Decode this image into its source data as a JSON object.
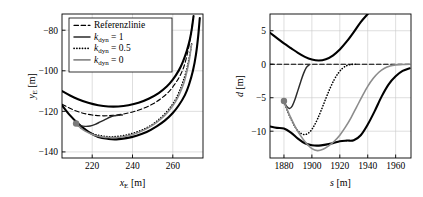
{
  "figure": {
    "panels": [
      "left",
      "right"
    ]
  },
  "chart_data": [
    {
      "id": "left",
      "type": "line",
      "title": "",
      "xlabel": "x_E [m]",
      "ylabel": "y_E [m]",
      "xlabel_parts": {
        "sym": "x",
        "sub": "E",
        "unit": "[m]"
      },
      "ylabel_parts": {
        "sym": "y",
        "sub": "E",
        "unit": "[m]"
      },
      "xlim": [
        205,
        275
      ],
      "ylim": [
        -143,
        -72
      ],
      "xticks": [
        220,
        240,
        260
      ],
      "yticks": [
        -80,
        -100,
        -120,
        -140
      ],
      "xticklabels": [
        "220",
        "240",
        "260"
      ],
      "yticklabels": [
        "-80",
        "-100",
        "-120",
        "-140"
      ],
      "grid": true,
      "legend_position": "upper-left",
      "legend_entries": [
        {
          "label": "Referenzlinie",
          "style": "dashed",
          "color": "#000000"
        },
        {
          "label": "k_dyn = 1",
          "style": "solid",
          "color": "#000000"
        },
        {
          "label": "k_dyn = 0.5",
          "style": "dotted",
          "color": "#000000"
        },
        {
          "label": "k_dyn = 0",
          "style": "solid",
          "color": "#8c8c8c"
        }
      ],
      "series": [
        {
          "name": "road-boundary-outer",
          "style": "solid-thick",
          "color": "#000000",
          "x": [
            205,
            209,
            213,
            218,
            223,
            228,
            233,
            238,
            243,
            248,
            253,
            257,
            260,
            263,
            265,
            267,
            268.5,
            269.5,
            270.3
          ],
          "y": [
            -110.0,
            -112.2,
            -114.0,
            -115.8,
            -117.0,
            -117.6,
            -117.6,
            -117.0,
            -115.8,
            -113.8,
            -111.0,
            -107.8,
            -104.4,
            -99.8,
            -95.6,
            -90.0,
            -84.5,
            -79.0,
            -73.0
          ]
        },
        {
          "name": "road-boundary-inner",
          "style": "solid-thick",
          "color": "#000000",
          "x": [
            205,
            209,
            213,
            218,
            223,
            228,
            232,
            237,
            242,
            247,
            252,
            256,
            260,
            263,
            266,
            268,
            270,
            271.5,
            272.6,
            273.4
          ],
          "y": [
            -117.0,
            -122.0,
            -126.0,
            -130.0,
            -132.6,
            -133.6,
            -133.8,
            -133.2,
            -132.0,
            -130.2,
            -127.4,
            -124.6,
            -120.8,
            -117.0,
            -112.0,
            -107.0,
            -100.0,
            -92.0,
            -83.0,
            -74.0
          ]
        },
        {
          "name": "reference-line",
          "style": "dashed",
          "color": "#000000",
          "x": [
            205,
            210,
            215,
            220,
            225,
            230,
            235,
            240,
            245,
            250,
            254,
            258,
            261,
            263.5,
            265.5,
            267,
            268.2,
            269.2,
            270
          ],
          "y": [
            -116.5,
            -119.0,
            -120.8,
            -121.8,
            -122.2,
            -122.0,
            -121.4,
            -120.3,
            -118.7,
            -116.4,
            -113.8,
            -110.4,
            -106.6,
            -102.6,
            -98.0,
            -92.6,
            -87.0,
            -81.0,
            -75.0
          ]
        },
        {
          "name": "trajectory-kdyn-1",
          "style": "solid",
          "color": "#2b2b2b",
          "x": [
            212,
            214,
            216.5,
            219,
            221.5,
            224,
            226.5,
            229,
            230.8,
            232,
            233.5,
            235
          ],
          "y": [
            -126.0,
            -126.9,
            -127.4,
            -127.2,
            -126.4,
            -125.2,
            -124.0,
            -122.8,
            -122.2,
            -122.0,
            -121.9,
            -121.8
          ]
        },
        {
          "name": "trajectory-kdyn-05",
          "style": "dotted",
          "color": "#000000",
          "x": [
            212,
            215,
            218,
            221,
            224,
            227,
            230,
            234,
            238,
            242,
            246,
            250,
            254,
            257.5,
            260.5,
            263,
            265,
            266.8,
            268.2,
            269.4
          ],
          "y": [
            -126.4,
            -128.6,
            -130.2,
            -131.3,
            -132.0,
            -132.4,
            -132.5,
            -132.2,
            -131.4,
            -130.2,
            -128.6,
            -126.4,
            -123.2,
            -119.6,
            -115.6,
            -110.8,
            -105.6,
            -99.8,
            -93.4,
            -86.6
          ]
        },
        {
          "name": "trajectory-kdyn-0",
          "style": "solid",
          "color": "#8c8c8c",
          "x": [
            212,
            214.5,
            217,
            219.5,
            222,
            225,
            228,
            232,
            236,
            240,
            244,
            248,
            252,
            256,
            259,
            261.5,
            263.5,
            265.5,
            267,
            268.3,
            269.3
          ],
          "y": [
            -126.0,
            -128.4,
            -130.0,
            -131.2,
            -132.0,
            -132.6,
            -132.9,
            -132.9,
            -132.4,
            -131.4,
            -130.0,
            -128.0,
            -125.4,
            -122.0,
            -118.6,
            -115.0,
            -111.0,
            -106.0,
            -100.4,
            -94.0,
            -87.0
          ]
        }
      ],
      "markers": [
        {
          "name": "start-position",
          "x": 212,
          "y": -126.0,
          "color": "#7a7a7a",
          "radius": 3.2
        }
      ]
    },
    {
      "id": "right",
      "type": "line",
      "title": "",
      "xlabel": "s [m]",
      "ylabel": "d [m]",
      "xlabel_parts": {
        "sym": "s",
        "sub": "",
        "unit": "[m]"
      },
      "ylabel_parts": {
        "sym": "d",
        "sub": "",
        "unit": "[m]"
      },
      "xlim": [
        1870,
        1971
      ],
      "ylim": [
        -14.0,
        7.5
      ],
      "xticks": [
        1880,
        1900,
        1920,
        1940,
        1960
      ],
      "yticks": [
        5,
        0,
        -5,
        -10
      ],
      "xticklabels": [
        "1880",
        "1900",
        "1920",
        "1940",
        "1960"
      ],
      "yticklabels": [
        "5",
        "0",
        "-5",
        "-10"
      ],
      "grid": true,
      "legend_position": "none",
      "series": [
        {
          "name": "road-boundary-upper",
          "style": "solid-thick",
          "color": "#000000",
          "x": [
            1870,
            1875,
            1880,
            1885,
            1890,
            1895,
            1900,
            1905,
            1910,
            1915,
            1920,
            1925,
            1930,
            1935,
            1940,
            1943
          ],
          "y": [
            4.7,
            3.9,
            3.1,
            2.4,
            1.7,
            1.1,
            0.7,
            0.55,
            0.75,
            1.3,
            2.2,
            3.4,
            4.8,
            6.3,
            7.5,
            8.2
          ]
        },
        {
          "name": "road-boundary-lower",
          "style": "solid-thick",
          "color": "#000000",
          "x": [
            1870,
            1875,
            1880,
            1885,
            1890,
            1895,
            1900,
            1905,
            1910,
            1915,
            1920,
            1925,
            1930,
            1935,
            1940,
            1945,
            1950,
            1955,
            1960,
            1965,
            1970
          ],
          "y": [
            -9.3,
            -9.5,
            -9.6,
            -10.2,
            -11.1,
            -11.8,
            -12.1,
            -12.15,
            -12.0,
            -11.8,
            -11.5,
            -11.4,
            -11.35,
            -10.6,
            -9.0,
            -7.0,
            -4.8,
            -3.0,
            -1.8,
            -1.0,
            -0.6
          ]
        },
        {
          "name": "reference-line",
          "style": "dashed",
          "color": "#000000",
          "x": [
            1870,
            1970
          ],
          "y": [
            0.0,
            0.0
          ]
        },
        {
          "name": "trajectory-kdyn-1",
          "style": "solid",
          "color": "#2b2b2b",
          "x": [
            1880,
            1882,
            1884,
            1886,
            1888,
            1890,
            1892,
            1894,
            1896,
            1898
          ],
          "y": [
            -5.5,
            -6.3,
            -6.6,
            -6.2,
            -5.2,
            -3.9,
            -2.6,
            -1.4,
            -0.5,
            -0.1
          ]
        },
        {
          "name": "trajectory-kdyn-05",
          "style": "dotted",
          "color": "#000000",
          "x": [
            1880,
            1883,
            1886,
            1889,
            1892,
            1895,
            1898,
            1901,
            1904,
            1907,
            1910,
            1913,
            1916,
            1919,
            1922,
            1925,
            1928,
            1931
          ],
          "y": [
            -5.6,
            -7.2,
            -8.6,
            -9.7,
            -10.3,
            -10.5,
            -10.2,
            -9.4,
            -8.2,
            -6.7,
            -5.1,
            -3.6,
            -2.3,
            -1.3,
            -0.6,
            -0.2,
            -0.05,
            0.0
          ]
        },
        {
          "name": "trajectory-kdyn-0",
          "style": "solid",
          "color": "#8c8c8c",
          "x": [
            1880,
            1884,
            1888,
            1892,
            1896,
            1900,
            1904,
            1908,
            1912,
            1916,
            1920,
            1924,
            1928,
            1932,
            1936,
            1940,
            1944,
            1948,
            1952,
            1956,
            1960,
            1965,
            1970
          ],
          "y": [
            -5.6,
            -7.6,
            -9.3,
            -10.7,
            -11.8,
            -12.6,
            -12.9,
            -12.7,
            -12.2,
            -11.5,
            -10.6,
            -9.4,
            -8.0,
            -6.4,
            -4.8,
            -3.3,
            -2.1,
            -1.2,
            -0.6,
            -0.25,
            -0.1,
            -0.05,
            0.0
          ]
        }
      ],
      "markers": [
        {
          "name": "start-position",
          "x": 1880,
          "y": -5.5,
          "color": "#7a7a7a",
          "radius": 3.2
        }
      ]
    }
  ]
}
